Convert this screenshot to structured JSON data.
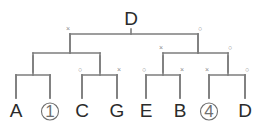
{
  "figure": {
    "name": "binary-recombination-tree",
    "background_color": "#ffffff",
    "line_color": "#7d7d7d",
    "label_color": "#2b2b2b",
    "marker_color": "#8c8c8c",
    "circled_color": "#6f6f6f"
  },
  "root": {
    "label": "D",
    "x": 131,
    "y": 18
  },
  "markers": {
    "cross": "×",
    "circle": "○"
  },
  "nodes": [
    {
      "id": "root",
      "level": 0,
      "label": "D",
      "stem_x": 131,
      "bar_y": 34,
      "left_x": 70,
      "right_x": 198,
      "left_marker": "×",
      "right_marker": "○"
    },
    {
      "id": "left-level2",
      "level": 1,
      "stem_x": 70,
      "bar_y": 53,
      "left_x": 33,
      "right_x": 100,
      "left_marker": "",
      "right_marker": ""
    },
    {
      "id": "right-level2",
      "level": 1,
      "stem_x": 198,
      "bar_y": 53,
      "left_x": 163,
      "right_x": 228,
      "left_marker": "×",
      "right_marker": "○"
    },
    {
      "id": "leaf-group-1",
      "level": 2,
      "stem_x": 33,
      "bar_y": 75,
      "left_x": 16,
      "right_x": 50,
      "left_marker": "",
      "right_marker": ""
    },
    {
      "id": "leaf-group-2",
      "level": 2,
      "stem_x": 100,
      "bar_y": 75,
      "left_x": 82,
      "right_x": 117,
      "left_marker": "○",
      "right_marker": "×"
    },
    {
      "id": "leaf-group-3",
      "level": 2,
      "stem_x": 163,
      "bar_y": 75,
      "left_x": 146,
      "right_x": 180,
      "left_marker": "○",
      "right_marker": "×"
    },
    {
      "id": "leaf-group-4",
      "level": 2,
      "stem_x": 228,
      "bar_y": 75,
      "left_x": 209,
      "right_x": 245,
      "left_marker": "×",
      "right_marker": "○"
    }
  ],
  "leaves": [
    {
      "id": "leaf-a",
      "label": "A",
      "circled": false,
      "x": 16,
      "text_y": 117,
      "stem_top": 75,
      "stem_bottom": 98
    },
    {
      "id": "leaf-1",
      "label": "1",
      "circled": true,
      "x": 50,
      "text_y": 117,
      "stem_top": 75,
      "stem_bottom": 98
    },
    {
      "id": "leaf-c",
      "label": "C",
      "circled": false,
      "x": 82,
      "text_y": 117,
      "stem_top": 75,
      "stem_bottom": 98
    },
    {
      "id": "leaf-g",
      "label": "G",
      "circled": false,
      "x": 117,
      "text_y": 117,
      "stem_top": 75,
      "stem_bottom": 98
    },
    {
      "id": "leaf-e",
      "label": "E",
      "circled": false,
      "x": 146,
      "text_y": 117,
      "stem_top": 75,
      "stem_bottom": 98
    },
    {
      "id": "leaf-b",
      "label": "B",
      "circled": false,
      "x": 180,
      "text_y": 117,
      "stem_top": 75,
      "stem_bottom": 98
    },
    {
      "id": "leaf-4",
      "label": "4",
      "circled": true,
      "x": 209,
      "text_y": 117,
      "stem_top": 75,
      "stem_bottom": 98
    },
    {
      "id": "leaf-d",
      "label": "D",
      "circled": false,
      "x": 245,
      "text_y": 117,
      "stem_top": 75,
      "stem_bottom": 98
    }
  ]
}
